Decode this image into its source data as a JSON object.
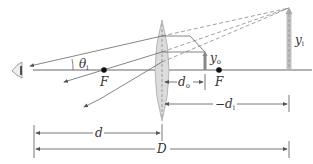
{
  "diagram": {
    "type": "magnifier-optics",
    "colors": {
      "line": "#666666",
      "axis": "#555555",
      "lens_fill": "#dcdcdc",
      "lens_stroke": "#aaaaaa",
      "object": "#888888",
      "image": "#b0b0b0",
      "focal_point": "#111111",
      "text": "#333333"
    },
    "labels": {
      "theta": "θ",
      "theta_sub": "i",
      "focal_left": "F",
      "focal_right": "F",
      "object_height": "y",
      "object_height_sub": "o",
      "image_height": "y",
      "image_height_sub": "i",
      "object_distance": "d",
      "object_distance_sub": "o",
      "image_distance_prefix": "−d",
      "image_distance_sub": "i",
      "lens_to_eye": "d",
      "total_distance": "D"
    },
    "elements": {
      "eye": "eye-icon",
      "lens": "converging-lens",
      "object": "object-arrow",
      "image": "virtual-image-arrow"
    }
  }
}
